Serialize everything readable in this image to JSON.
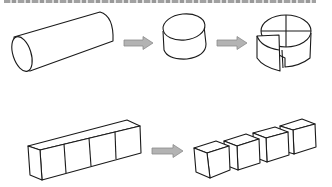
{
  "caption": {
    "visible": "clipped",
    "text": ""
  },
  "diagram": {
    "title": "",
    "rows": [
      {
        "id": "cylinder-row",
        "stages": [
          {
            "shape": "long-cylinder",
            "label": ""
          },
          {
            "shape": "arrow",
            "label": ""
          },
          {
            "shape": "short-cylinder",
            "label": ""
          },
          {
            "shape": "arrow",
            "label": ""
          },
          {
            "shape": "cylinder-cut-into-quarters",
            "label": "",
            "pieces": 4
          }
        ]
      },
      {
        "id": "prism-row",
        "stages": [
          {
            "shape": "rectangular-prism-with-4-sections",
            "label": "",
            "sections": 4
          },
          {
            "shape": "arrow",
            "label": ""
          },
          {
            "shape": "four-separated-cubes",
            "label": "",
            "pieces": 4
          }
        ]
      }
    ],
    "colors": {
      "outline": "#1a1a1a",
      "arrow_fill": "#b3b3b3",
      "background": "#ffffff"
    }
  }
}
